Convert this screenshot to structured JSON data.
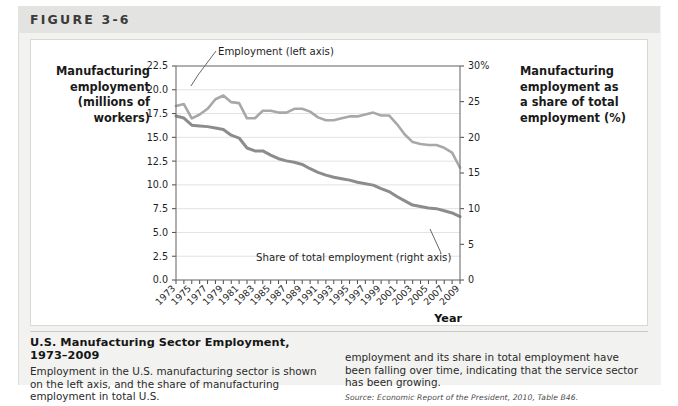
{
  "figure": {
    "label": "FIGURE 3-6"
  },
  "axis_titles": {
    "left_line1": "Manufacturing",
    "left_line2": "employment",
    "left_line3": "(millions of",
    "left_line4": "workers)",
    "right_line1": "Manufacturing",
    "right_line2": "employment as",
    "right_line3": "a share of total",
    "right_line4": "employment (%)",
    "x_title": "Year"
  },
  "caption": {
    "title": "U.S. Manufacturing Sector Employment, 1973–2009",
    "body_left": "Employment in the U.S. manufacturing sector is shown on the left axis, and the share of manufacturing employment in total U.S.",
    "body_right": "employment and its share in total employment have been falling over time, indicating that the service sector has been growing.",
    "source": "Source: Economic Report of the President, 2010, Table B46."
  },
  "chart_data": {
    "type": "line",
    "title": "U.S. Manufacturing Sector Employment, 1973–2009",
    "xlabel": "Year",
    "ylabel": "Manufacturing employment (millions of workers)",
    "y2label": "Manufacturing employment as a share of total employment (%)",
    "grid": true,
    "legend": "inline-annotations",
    "xlim": [
      1973,
      2009
    ],
    "ylim": [
      0.0,
      22.5
    ],
    "y2lim": [
      0,
      30
    ],
    "ytick_labels": [
      "0.0",
      "2.5",
      "5.0",
      "7.5",
      "10.0",
      "12.5",
      "15.0",
      "17.5",
      "20.0",
      "22.5"
    ],
    "ytick_values": [
      0.0,
      2.5,
      5.0,
      7.5,
      10.0,
      12.5,
      15.0,
      17.5,
      20.0,
      22.5
    ],
    "y2tick_labels": [
      "0",
      "5",
      "10",
      "15",
      "20",
      "25",
      "30%"
    ],
    "y2tick_values": [
      0,
      5,
      10,
      15,
      20,
      25,
      30
    ],
    "xtick_labels": [
      "1973",
      "1975",
      "1977",
      "1979",
      "1981",
      "1983",
      "1985",
      "1987",
      "1989",
      "1991",
      "1993",
      "1995",
      "1997",
      "1999",
      "2001",
      "2003",
      "2005",
      "2007",
      "2009"
    ],
    "x": [
      1973,
      1974,
      1975,
      1976,
      1977,
      1978,
      1979,
      1980,
      1981,
      1982,
      1983,
      1984,
      1985,
      1986,
      1987,
      1988,
      1989,
      1990,
      1991,
      1992,
      1993,
      1994,
      1995,
      1996,
      1997,
      1998,
      1999,
      2000,
      2001,
      2002,
      2003,
      2004,
      2005,
      2006,
      2007,
      2008,
      2009
    ],
    "series": [
      {
        "name": "Employment (left axis)",
        "axis": "left",
        "color": "#a8a8a8",
        "annotation": "Employment (left axis)",
        "values": [
          18.3,
          18.5,
          17.0,
          17.4,
          18.0,
          19.0,
          19.4,
          18.7,
          18.6,
          17.0,
          17.0,
          17.8,
          17.8,
          17.6,
          17.6,
          18.0,
          18.0,
          17.7,
          17.1,
          16.8,
          16.8,
          17.0,
          17.2,
          17.2,
          17.4,
          17.6,
          17.3,
          17.3,
          16.4,
          15.3,
          14.5,
          14.3,
          14.2,
          14.2,
          13.9,
          13.4,
          11.8
        ]
      },
      {
        "name": "Share of total employment (right axis)",
        "axis": "right",
        "color": "#8c8c8c",
        "annotation": "Share of total employment (right axis)",
        "values": [
          23.0,
          22.7,
          21.7,
          21.6,
          21.5,
          21.3,
          21.1,
          20.3,
          19.9,
          18.5,
          18.1,
          18.1,
          17.5,
          17.0,
          16.7,
          16.5,
          16.2,
          15.6,
          15.1,
          14.7,
          14.4,
          14.2,
          14.0,
          13.7,
          13.5,
          13.3,
          12.8,
          12.4,
          11.7,
          11.1,
          10.5,
          10.3,
          10.1,
          10.0,
          9.7,
          9.4,
          8.9
        ]
      }
    ]
  }
}
